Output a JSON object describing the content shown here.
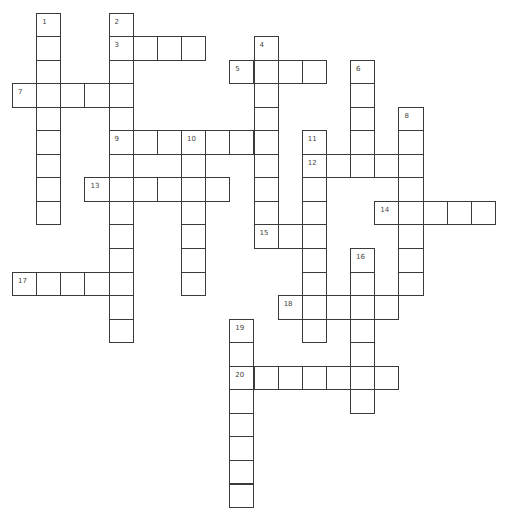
{
  "puzzle": {
    "type": "crossword",
    "colors": {
      "border": "#3a3a3a",
      "label": "#444444",
      "background": "#ffffff"
    },
    "entries": [
      {
        "number": "1",
        "direction": "down",
        "row": 0,
        "col": 1,
        "length": 9,
        "answer": ""
      },
      {
        "number": "2",
        "direction": "down",
        "row": 0,
        "col": 4,
        "length": 14,
        "answer": ""
      },
      {
        "number": "3",
        "direction": "across",
        "row": 1,
        "col": 4,
        "length": 4,
        "answer": ""
      },
      {
        "number": "4",
        "direction": "down",
        "row": 1,
        "col": 10,
        "length": 9,
        "answer": ""
      },
      {
        "number": "5",
        "direction": "across",
        "row": 2,
        "col": 9,
        "length": 4,
        "answer": ""
      },
      {
        "number": "6",
        "direction": "down",
        "row": 2,
        "col": 14,
        "length": 5,
        "answer": ""
      },
      {
        "number": "7",
        "direction": "across",
        "row": 3,
        "col": 0,
        "length": 5,
        "answer": ""
      },
      {
        "number": "8",
        "direction": "down",
        "row": 4,
        "col": 16,
        "length": 8,
        "answer": ""
      },
      {
        "number": "9",
        "direction": "across",
        "row": 5,
        "col": 4,
        "length": 7,
        "answer": ""
      },
      {
        "number": "10",
        "direction": "down",
        "row": 5,
        "col": 7,
        "length": 7,
        "answer": ""
      },
      {
        "number": "11",
        "direction": "down",
        "row": 5,
        "col": 12,
        "length": 9,
        "answer": ""
      },
      {
        "number": "12",
        "direction": "across",
        "row": 6,
        "col": 12,
        "length": 5,
        "answer": ""
      },
      {
        "number": "13",
        "direction": "across",
        "row": 7,
        "col": 3,
        "length": 6,
        "answer": ""
      },
      {
        "number": "14",
        "direction": "across",
        "row": 8,
        "col": 15,
        "length": 5,
        "answer": ""
      },
      {
        "number": "15",
        "direction": "across",
        "row": 9,
        "col": 10,
        "length": 3,
        "answer": ""
      },
      {
        "number": "16",
        "direction": "down",
        "row": 10,
        "col": 14,
        "length": 7,
        "answer": ""
      },
      {
        "number": "17",
        "direction": "across",
        "row": 11,
        "col": 0,
        "length": 5,
        "answer": ""
      },
      {
        "number": "18",
        "direction": "across",
        "row": 12,
        "col": 11,
        "length": 5,
        "answer": ""
      },
      {
        "number": "19",
        "direction": "down",
        "row": 13,
        "col": 9,
        "length": 8,
        "answer": ""
      },
      {
        "number": "20",
        "direction": "across",
        "row": 15,
        "col": 9,
        "length": 7,
        "answer": ""
      }
    ]
  }
}
